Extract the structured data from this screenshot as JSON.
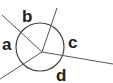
{
  "diagram": {
    "type": "angles-around-point",
    "labels": {
      "a": "a",
      "b": "b",
      "c": "c",
      "d": "d"
    },
    "colors": {
      "stroke": "#444444",
      "text": "#222222",
      "background": "#ffffff"
    }
  }
}
